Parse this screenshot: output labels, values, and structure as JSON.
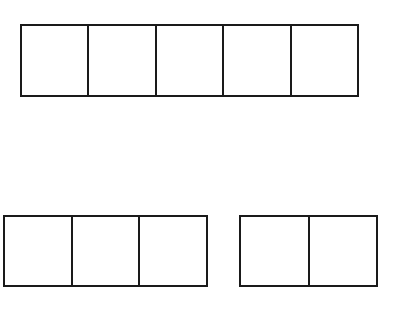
{
  "diagram": {
    "stroke_color": "#1a1a1a",
    "background": "#ffffff",
    "strips": [
      {
        "name": "top-strip",
        "cells": 5,
        "x": 20,
        "y": 24,
        "width": 339,
        "height": 73
      },
      {
        "name": "bottom-left-strip",
        "cells": 3,
        "x": 3,
        "y": 215,
        "width": 205,
        "height": 72
      },
      {
        "name": "bottom-right-strip",
        "cells": 2,
        "x": 239,
        "y": 215,
        "width": 139,
        "height": 72
      }
    ]
  }
}
